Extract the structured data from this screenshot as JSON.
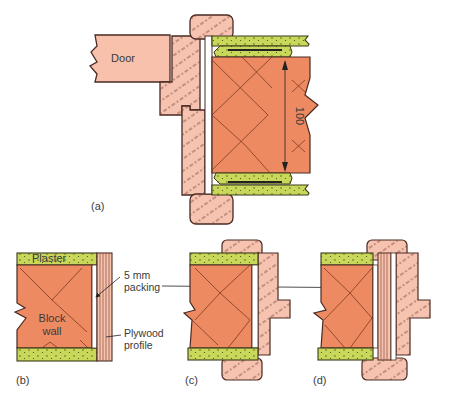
{
  "figure": {
    "panels": [
      {
        "id": "a",
        "label": "(a)"
      },
      {
        "id": "b",
        "label": "(b)"
      },
      {
        "id": "c",
        "label": "(c)"
      },
      {
        "id": "d",
        "label": "(d)"
      }
    ],
    "labels": {
      "door": "Door",
      "dimension": "100",
      "plaster": "Plaster",
      "block_wall_line1": "Block",
      "block_wall_line2": "wall",
      "packing_line1": "5 mm",
      "packing_line2": "packing",
      "plywood_line1": "Plywood",
      "plywood_line2": "profile"
    },
    "colors": {
      "block": "#ee8a62",
      "timber": "#f6c3b0",
      "door": "#f7c1ac",
      "plaster": "#c9d75a",
      "outline": "#4a2a22",
      "grain": "#7a4030"
    }
  }
}
